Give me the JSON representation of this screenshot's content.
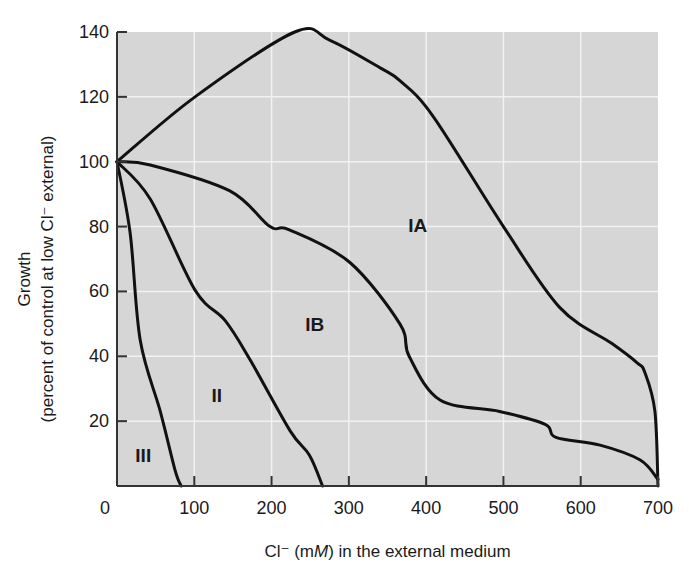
{
  "chart_data": {
    "type": "line",
    "title": "",
    "xlabel": "Cl⁻ (mM) in the external medium",
    "xlabel_parts": {
      "prefix": "Cl⁻ (m",
      "italic": "M",
      "suffix": ") in the external medium"
    },
    "ylabel": "Growth (percent of control at low Cl⁻ external)",
    "ylabel_lines": [
      "Growth",
      "(percent of control at low Cl⁻ external)"
    ],
    "xlim": [
      0,
      700
    ],
    "ylim": [
      0,
      140
    ],
    "x_ticks": [
      0,
      100,
      200,
      300,
      400,
      500,
      600,
      700
    ],
    "y_ticks": [
      20,
      40,
      60,
      80,
      100,
      120,
      140
    ],
    "grid": true,
    "legend": "none (regions labeled in-plot)",
    "series": [
      {
        "name": "IA upper boundary",
        "x": [
          0,
          101,
          230,
          275,
          340,
          366,
          409,
          500,
          573,
          640,
          673,
          683,
          696,
          700
        ],
        "y": [
          100,
          120,
          140,
          137.5,
          129,
          125,
          114,
          80,
          55,
          44,
          38,
          35,
          23,
          0
        ]
      },
      {
        "name": "IA / IB boundary",
        "x": [
          0,
          43,
          146,
          198,
          223,
          301,
          366,
          378,
          418,
          495,
          554,
          568,
          625,
          677,
          700
        ],
        "y": [
          100,
          99,
          91,
          80,
          79,
          69,
          50,
          40,
          26.5,
          23,
          19,
          15,
          12.6,
          8,
          2
        ]
      },
      {
        "name": "IB / II boundary",
        "x": [
          0,
          43,
          101,
          140,
          172,
          224,
          249,
          266
        ],
        "y": [
          100,
          88.5,
          60.4,
          51,
          39,
          17,
          9.5,
          0
        ]
      },
      {
        "name": "II / III boundary",
        "x": [
          0,
          17,
          30,
          56,
          75,
          83
        ],
        "y": [
          100,
          78,
          45,
          23,
          5,
          0
        ]
      }
    ],
    "annotations": [
      {
        "text": "IA",
        "x": 389,
        "y": 80.5
      },
      {
        "text": "IB",
        "x": 256,
        "y": 50
      },
      {
        "text": "II",
        "x": 129,
        "y": 28
      },
      {
        "text": "III",
        "x": 34,
        "y": 9.5
      }
    ],
    "colors": {
      "plot_bg": "#d6d6d6",
      "grid": "#f2f2f2",
      "line": "#111111",
      "axis": "#333333"
    }
  }
}
